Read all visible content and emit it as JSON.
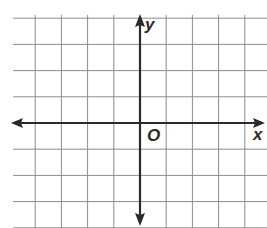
{
  "chart_data": {
    "type": "scatter",
    "title": "",
    "xlabel": "x",
    "ylabel": "y",
    "origin_label": "O",
    "grid": true,
    "grid_color": "#8c8c8c",
    "axis_color": "#2a2a2a",
    "x_range": [
      -5,
      5
    ],
    "y_range": [
      -4,
      5
    ],
    "points": [],
    "layout": {
      "origin_px": [
        140,
        123
      ],
      "cell_px": 26.2,
      "grid_left_px": 13,
      "grid_top_px": 15,
      "grid_right_px": 267,
      "grid_bottom_px": 228
    }
  },
  "labels": {
    "x_axis": "x",
    "y_axis": "y",
    "origin": "O"
  }
}
